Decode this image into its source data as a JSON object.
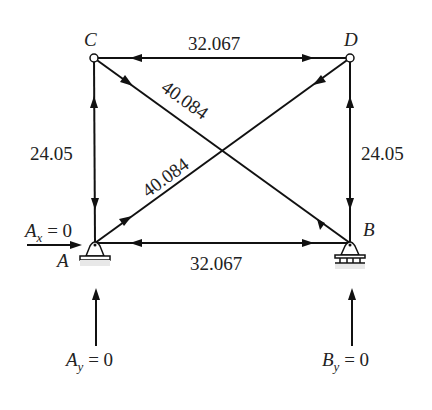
{
  "diagram": {
    "type": "truss-free-body",
    "nodes": [
      {
        "id": "C",
        "label": "C",
        "x": 94,
        "y": 58
      },
      {
        "id": "D",
        "label": "D",
        "x": 350,
        "y": 58
      },
      {
        "id": "A",
        "label": "A",
        "x": 95,
        "y": 243
      },
      {
        "id": "B",
        "label": "B",
        "x": 350,
        "y": 243
      }
    ],
    "members": [
      {
        "from": "C",
        "to": "D",
        "force": "32.067"
      },
      {
        "from": "A",
        "to": "B",
        "force": "32.067"
      },
      {
        "from": "A",
        "to": "C",
        "force": "24.05"
      },
      {
        "from": "B",
        "to": "D",
        "force": "24.05"
      },
      {
        "from": "C",
        "to": "B",
        "force": "40.084"
      },
      {
        "from": "A",
        "to": "D",
        "force": "40.084"
      }
    ],
    "labels": {
      "top": "32.067",
      "bottom": "32.067",
      "left": "24.05",
      "right": "24.05",
      "diag_cb": "40.084",
      "diag_ad": "40.084",
      "node_c": "C",
      "node_d": "D",
      "node_a": "A",
      "node_b": "B"
    },
    "reactions": {
      "ax": {
        "symbol": "A",
        "sub": "x",
        "eq": " = 0"
      },
      "ay": {
        "symbol": "A",
        "sub": "y",
        "eq": " = 0"
      },
      "by": {
        "symbol": "B",
        "sub": "y",
        "eq": " = 0"
      }
    },
    "supports": {
      "A": "pin",
      "B": "roller"
    },
    "colors": {
      "line": "#111111",
      "text": "#222222",
      "background": "#ffffff"
    }
  }
}
